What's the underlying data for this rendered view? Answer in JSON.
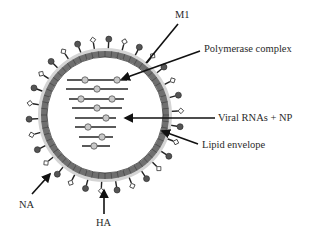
{
  "diagram": {
    "labels": {
      "m1": "M1",
      "polymerase": "Polymerase complex",
      "viral_rnas": "Viral RNAs + NP",
      "lipid_envelope": "Lipid envelope",
      "na": "NA",
      "ha": "HA"
    },
    "colors": {
      "shell": "#7a7a7a",
      "halo": "#d0d0d0",
      "spike_ball": "#555555",
      "spike_diamond": "#ffffff",
      "rna_line": "#5a5a5a",
      "rna_bead": "#c8c8c8",
      "arrow": "#111111"
    },
    "virus": {
      "cx": 105,
      "cy": 115,
      "inner_radius": 58,
      "spike_count": 30
    },
    "rna_segments": [
      {
        "y": 80,
        "x1": 67,
        "x2": 127,
        "beads": [
          85,
          117
        ]
      },
      {
        "y": 89,
        "x1": 66,
        "x2": 128,
        "beads": [
          97
        ]
      },
      {
        "y": 99,
        "x1": 69,
        "x2": 124,
        "beads": [
          81,
          112
        ]
      },
      {
        "y": 108,
        "x1": 72,
        "x2": 122,
        "beads": [
          97
        ]
      },
      {
        "y": 118,
        "x1": 75,
        "x2": 116,
        "beads": [
          106
        ]
      },
      {
        "y": 127,
        "x1": 75,
        "x2": 116,
        "beads": [
          88
        ]
      },
      {
        "y": 137,
        "x1": 79,
        "x2": 113,
        "beads": [
          102
        ]
      },
      {
        "y": 146,
        "x1": 82,
        "x2": 110,
        "beads": [
          94
        ]
      }
    ]
  }
}
